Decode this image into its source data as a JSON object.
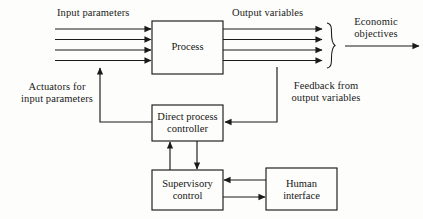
{
  "diagram": {
    "background_color": "#fdfdfb",
    "stroke_color": "#1a1a1a",
    "text_color": "#151515",
    "boxes": [
      {
        "id": "process",
        "label": "Process",
        "x": 152,
        "y": 21,
        "w": 71,
        "h": 53
      },
      {
        "id": "direct-process-controller",
        "label": "Direct process\ncontroller",
        "x": 152,
        "y": 105,
        "w": 71,
        "h": 36
      },
      {
        "id": "supervisory-control",
        "label": "Supervisory\ncontrol",
        "x": 152,
        "y": 170,
        "w": 71,
        "h": 40
      },
      {
        "id": "human-interface",
        "label": "Human\ninterface",
        "x": 266,
        "y": 168,
        "w": 71,
        "h": 42
      }
    ],
    "labels": [
      {
        "id": "input-parameters",
        "text": "Input parameters",
        "x": 57,
        "y": 7
      },
      {
        "id": "output-variables",
        "text": "Output variables",
        "x": 232,
        "y": 7
      },
      {
        "id": "economic-objectives",
        "text": "Economic\nobjectives",
        "x": 347,
        "y": 16
      },
      {
        "id": "actuators-for-input-parameters",
        "text": "Actuators for\ninput parameters",
        "x": 16,
        "y": 81
      },
      {
        "id": "feedback-from-output-variables",
        "text": "Feedback from\noutput variables",
        "x": 282,
        "y": 80
      }
    ],
    "flows": {
      "input_arrow_count": 4,
      "output_arrow_count": 4,
      "input_arrow_y": [
        29,
        39.5,
        50,
        60.5
      ],
      "output_arrow_y": [
        29,
        39.5,
        50,
        60.5
      ],
      "input_arrow_x_start": 55,
      "output_arrow_x_end": 322,
      "brace_x": 330,
      "brace_top": 23,
      "brace_bottom": 68,
      "economic_arrow": {
        "x1": 345,
        "x2": 419,
        "y": 46
      },
      "feedback_line_x": 277,
      "feedback_tap_y": 67,
      "actuator_line_x": 100,
      "actuator_arrow_top_y": 67,
      "controller_to_supervisory_down_x": 197,
      "supervisory_to_controller_up_x": 170
    }
  }
}
